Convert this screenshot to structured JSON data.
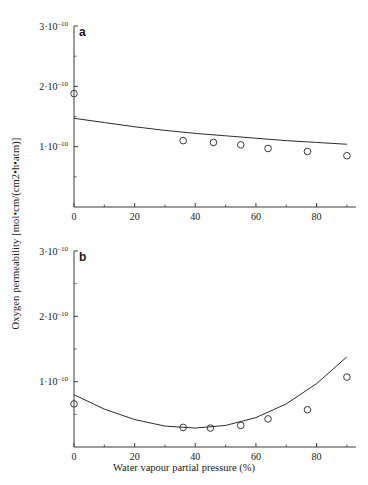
{
  "figure": {
    "xlabel": "Water vapour partial pressure (%)",
    "ylabel": "Oxygen permeability [mol•cm/(cm2•h•atm)]",
    "panel_a_letter": "a",
    "panel_b_letter": "b",
    "line_color": "#2b2b2b",
    "marker_color": "#3a3a3a",
    "axis_color": "#3a3a3a",
    "background": "#ffffff"
  },
  "xticks": {
    "values": [
      0,
      20,
      40,
      60,
      80
    ],
    "labels": [
      "0",
      "20",
      "40",
      "60",
      "80"
    ]
  },
  "yticks": {
    "values": [
      1e-10,
      2e-10,
      3e-10
    ],
    "labels": [
      "1·10",
      "2·10",
      "3·10"
    ],
    "exponent": "–10",
    "minor_values": [
      5e-11,
      1.5e-10,
      2.5e-10
    ]
  },
  "chart_data": [
    {
      "type": "scatter",
      "panel": "a",
      "title": "",
      "xlabel": "Water vapour partial pressure (%)",
      "ylabel": "Oxygen permeability [mol•cm/(cm2•h•atm)]",
      "xlim": [
        0,
        93
      ],
      "ylim": [
        0,
        3e-10
      ],
      "grid": false,
      "legend": "none",
      "series": [
        {
          "name": "measured points",
          "marker": "open-circle",
          "x": [
            0,
            36,
            46,
            55,
            64,
            77,
            90
          ],
          "y": [
            1.88e-10,
            1.1e-10,
            1.07e-10,
            1.03e-10,
            9.7e-11,
            9.2e-11,
            8.5e-11
          ]
        },
        {
          "name": "fitted curve",
          "marker": "line",
          "x": [
            0,
            10,
            20,
            30,
            40,
            50,
            60,
            70,
            80,
            90
          ],
          "y": [
            1.47e-10,
            1.4e-10,
            1.33e-10,
            1.27e-10,
            1.22e-10,
            1.18e-10,
            1.14e-10,
            1.1e-10,
            1.07e-10,
            1.04e-10
          ]
        }
      ]
    },
    {
      "type": "scatter",
      "panel": "b",
      "title": "",
      "xlabel": "Water vapour partial pressure (%)",
      "ylabel": "Oxygen permeability [mol•cm/(cm2•h•atm)]",
      "xlim": [
        0,
        93
      ],
      "ylim": [
        0,
        3e-10
      ],
      "grid": false,
      "legend": "none",
      "series": [
        {
          "name": "measured points",
          "marker": "open-circle",
          "x": [
            0,
            36,
            45,
            55,
            64,
            77,
            90
          ],
          "y": [
            6.6e-11,
            3e-11,
            2.9e-11,
            3.3e-11,
            4.3e-11,
            5.7e-11,
            1.07e-10
          ]
        },
        {
          "name": "fitted curve",
          "marker": "line",
          "x": [
            0,
            10,
            20,
            30,
            40,
            50,
            60,
            70,
            80,
            90
          ],
          "y": [
            8e-11,
            5.8e-11,
            4.2e-11,
            3.2e-11,
            2.9e-11,
            3.3e-11,
            4.5e-11,
            6.6e-11,
            9.7e-11,
            1.38e-10
          ]
        }
      ]
    }
  ]
}
